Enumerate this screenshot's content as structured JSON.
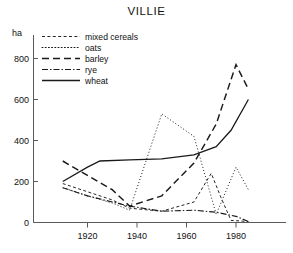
{
  "chart_data": {
    "type": "line",
    "title": "VILLIE",
    "xlabel": "",
    "ylabel": "ha",
    "ylim": [
      0,
      900
    ],
    "xlim": [
      1908,
      1987
    ],
    "grid": false,
    "legend_position": "top-left-inside",
    "y_ticks": [
      "0",
      "200",
      "400",
      "600",
      "800"
    ],
    "y_tick_values": [
      0,
      200,
      400,
      600,
      800
    ],
    "x_ticks": [
      "1920",
      "1940",
      "1960",
      "1980"
    ],
    "x_tick_values": [
      1920,
      1940,
      1960,
      1980
    ],
    "series": [
      {
        "name": "mixed cereals",
        "style": "short-dash",
        "x": [
          1910,
          1920,
          1930,
          1937,
          1950,
          1963,
          1970,
          1974,
          1978,
          1985
        ],
        "values": [
          190,
          150,
          110,
          70,
          55,
          100,
          240,
          120,
          10,
          5
        ]
      },
      {
        "name": "oats",
        "style": "dotted",
        "x": [
          1910,
          1920,
          1930,
          1937,
          1950,
          1963,
          1968,
          1972,
          1980,
          1985
        ],
        "values": [
          170,
          130,
          95,
          60,
          530,
          420,
          210,
          40,
          270,
          160
        ]
      },
      {
        "name": "barley",
        "style": "long-dash",
        "x": [
          1910,
          1920,
          1930,
          1937,
          1950,
          1963,
          1972,
          1980,
          1985
        ],
        "values": [
          300,
          230,
          160,
          80,
          130,
          290,
          480,
          770,
          650
        ]
      },
      {
        "name": "rye",
        "style": "dash-dot",
        "x": [
          1910,
          1920,
          1930,
          1937,
          1950,
          1963,
          1972,
          1980,
          1985
        ],
        "values": [
          170,
          130,
          100,
          80,
          55,
          60,
          50,
          30,
          5
        ]
      },
      {
        "name": "wheat",
        "style": "solid",
        "x": [
          1910,
          1920,
          1925,
          1937,
          1950,
          1963,
          1972,
          1978,
          1985
        ],
        "values": [
          200,
          270,
          300,
          305,
          310,
          330,
          370,
          450,
          600
        ]
      }
    ]
  },
  "chart": {
    "title": "VILLIE",
    "y_axis_unit": "ha"
  },
  "legend": {
    "entries": [
      {
        "label": "mixed cereals",
        "style": "short-dash"
      },
      {
        "label": "oats",
        "style": "dotted"
      },
      {
        "label": "barley",
        "style": "long-dash"
      },
      {
        "label": "rye",
        "style": "dash-dot"
      },
      {
        "label": "wheat",
        "style": "solid"
      }
    ]
  }
}
